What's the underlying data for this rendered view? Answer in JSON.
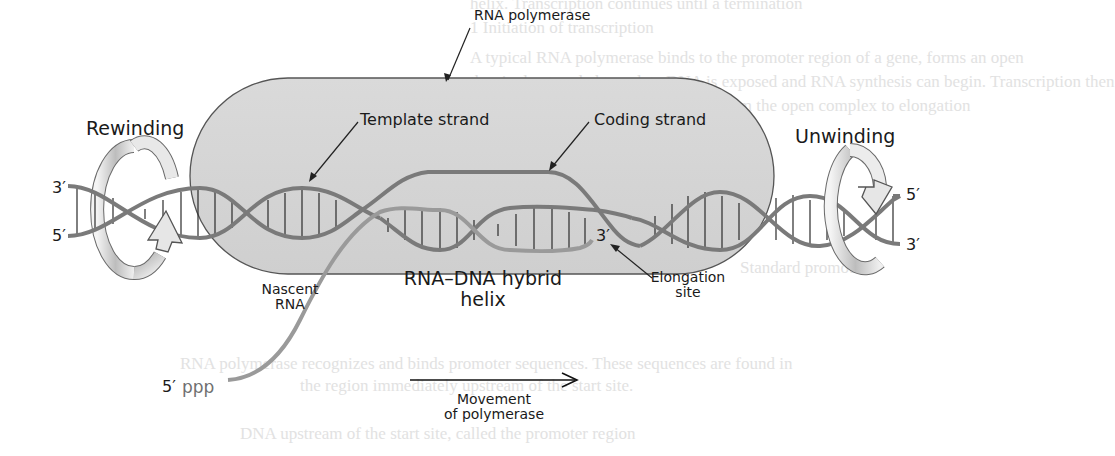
{
  "diagram": {
    "labels": {
      "rna_polymerase": "RNA polymerase",
      "rewinding": "Rewinding",
      "unwinding": "Unwinding",
      "template_strand": "Template strand",
      "coding_strand": "Coding strand",
      "nascent_rna_line1": "Nascent",
      "nascent_rna_line2": "RNA",
      "hybrid_line1": "RNA–DNA hybrid",
      "hybrid_line2": "helix",
      "elongation_line1": "Elongation",
      "elongation_line2": "site",
      "movement_line1": "Movement",
      "movement_line2": "of polymerase",
      "left_top_end": "3′",
      "left_bottom_end": "5′",
      "right_top_end": "5′",
      "right_bottom_end": "3′",
      "rna_3_end": "3′",
      "rna_5_end": "5′",
      "ppp": "ppp"
    },
    "background_text": [
      "helix. Transcription continues until a termination",
      "1  Initiation of transcription",
      "A typical RNA polymerase binds to the promoter region of a gene, forms an open",
      "the single-stranded template DNA is exposed and RNA synthesis can begin. Transcription then",
      "elongation can begin. The transition from the open complex to elongation",
      "Standard promoter",
      "RNA polymerase recognizes and binds promoter sequences. These sequences are found in",
      "the region immediately upstream of the start site.",
      "DNA upstream of the start site, called the promoter region"
    ],
    "colors": {
      "polymerase_fill": "#d4d4d4",
      "polymerase_stroke": "#555555",
      "dna_strand": "#7a7a7a",
      "rna_strand": "#9a9a9a",
      "rung": "#2a2a2a",
      "text": "#1a1a1a"
    }
  }
}
